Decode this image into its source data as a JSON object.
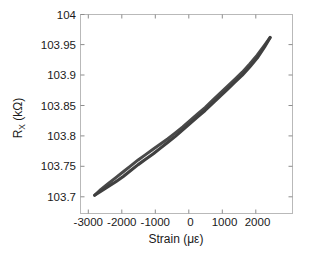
{
  "chart_data": {
    "type": "line",
    "title": "",
    "xlabel": "Strain (με)",
    "ylabel": "R_X (kΩ)",
    "ylabel_base": "R",
    "ylabel_sub": "X",
    "ylabel_unit": " (kΩ)",
    "xlim": [
      -3400,
      2300
    ],
    "ylim": [
      103.668,
      104.006
    ],
    "grid": false,
    "legend": false,
    "legend_position": "none",
    "line_color": "#3a3a3a",
    "background_color": "#ffffff",
    "frame_color": "#b9b9b9",
    "xticks": [
      -3000,
      -2000,
      -1000,
      0,
      1000,
      2000
    ],
    "xtick_labels": [
      "-3000",
      "-2000",
      "-1000",
      "0",
      "1000",
      "2000"
    ],
    "yticks": [
      103.7,
      103.75,
      103.8,
      103.85,
      103.9,
      103.95,
      104
    ],
    "ytick_labels": [
      "103.7",
      "103.75",
      "103.8",
      "103.85",
      "103.9",
      "103.95",
      "104"
    ],
    "series": [
      {
        "name": "loading",
        "x": [
          -3020,
          -2850,
          -2650,
          -2450,
          -2250,
          -2050,
          -1850,
          -1650,
          -1450,
          -1250,
          -1050,
          -850,
          -650,
          -450,
          -250,
          -50,
          150,
          350,
          550,
          750,
          950,
          1150,
          1350,
          1550,
          1700
        ],
        "y": [
          103.699,
          103.706,
          103.714,
          103.722,
          103.731,
          103.741,
          103.751,
          103.76,
          103.769,
          103.779,
          103.789,
          103.799,
          103.81,
          103.821,
          103.832,
          103.843,
          103.855,
          103.867,
          103.879,
          103.891,
          103.903,
          103.917,
          103.932,
          103.951,
          103.967
        ]
      },
      {
        "name": "unloading",
        "x": [
          1700,
          1550,
          1350,
          1150,
          950,
          750,
          550,
          350,
          150,
          -50,
          -250,
          -450,
          -650,
          -850,
          -1050,
          -1250,
          -1450,
          -1650,
          -1850,
          -2050,
          -2250,
          -2450,
          -2650,
          -2850,
          -3020
        ],
        "y": [
          103.967,
          103.954,
          103.937,
          103.922,
          103.908,
          103.896,
          103.884,
          103.872,
          103.86,
          103.848,
          103.837,
          103.826,
          103.815,
          103.805,
          103.795,
          103.786,
          103.777,
          103.768,
          103.759,
          103.749,
          103.739,
          103.729,
          103.719,
          103.709,
          103.699
        ]
      }
    ],
    "annotations": []
  },
  "figure": {
    "name": "resistance-strain-hysteresis-plot"
  }
}
